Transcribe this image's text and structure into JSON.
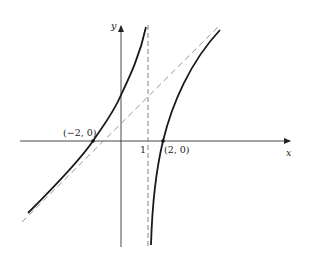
{
  "figure": {
    "axes": {
      "x_label": "x",
      "y_label": "y"
    },
    "tick_labels": {
      "x_one": "1"
    },
    "points": [
      {
        "label": "(−2, 0)",
        "x": -2,
        "y": 0
      },
      {
        "label": "(2, 0)",
        "x": 2,
        "y": 0
      }
    ],
    "asymptotes": {
      "vertical": "x = 1",
      "slant": "oblique (dashed)"
    },
    "colors": {
      "curve": "#1a1a1a",
      "axis": "#333333",
      "dashed": "#777777"
    }
  }
}
